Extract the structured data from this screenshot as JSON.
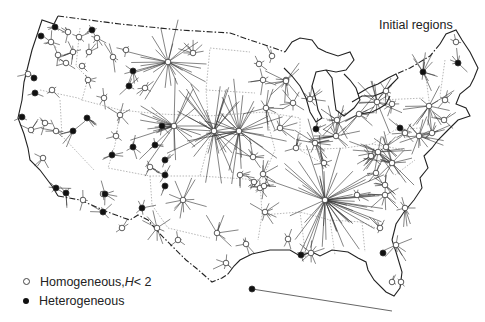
{
  "title": "Initial regions",
  "legend": {
    "homogeneous": {
      "label": "Homogeneous, ",
      "var": "H",
      "cond": " < 2",
      "symbol": "open-circle"
    },
    "heterogeneous": {
      "label": "Heterogeneous",
      "symbol": "filled-circle"
    }
  },
  "colors": {
    "line": "#222222",
    "spoke": "#333333",
    "border": "#999999",
    "background": "#ffffff"
  },
  "nodes": [
    {
      "x": 55,
      "y": 27,
      "type": "het",
      "spokes": 4,
      "len": 10
    },
    {
      "x": 41,
      "y": 36,
      "type": "het",
      "spokes": 0,
      "len": 0
    },
    {
      "x": 68,
      "y": 32,
      "type": "hom",
      "spokes": 5,
      "len": 12
    },
    {
      "x": 79,
      "y": 37,
      "type": "hom",
      "spokes": 4,
      "len": 10
    },
    {
      "x": 92,
      "y": 30,
      "type": "het",
      "spokes": 5,
      "len": 10
    },
    {
      "x": 97,
      "y": 38,
      "type": "hom",
      "spokes": 5,
      "len": 10
    },
    {
      "x": 51,
      "y": 42,
      "type": "hom",
      "spokes": 6,
      "len": 14
    },
    {
      "x": 73,
      "y": 52,
      "type": "hom",
      "spokes": 8,
      "len": 14
    },
    {
      "x": 89,
      "y": 52,
      "type": "hom",
      "spokes": 5,
      "len": 10
    },
    {
      "x": 58,
      "y": 55,
      "type": "hom",
      "spokes": 4,
      "len": 10
    },
    {
      "x": 66,
      "y": 63,
      "type": "hom",
      "spokes": 4,
      "len": 10
    },
    {
      "x": 82,
      "y": 66,
      "type": "hom",
      "spokes": 3,
      "len": 8
    },
    {
      "x": 113,
      "y": 57,
      "type": "hom",
      "spokes": 5,
      "len": 16
    },
    {
      "x": 126,
      "y": 50,
      "type": "hom",
      "spokes": 4,
      "len": 10
    },
    {
      "x": 168,
      "y": 62,
      "type": "hom",
      "spokes": 26,
      "len": 42
    },
    {
      "x": 193,
      "y": 53,
      "type": "hom",
      "spokes": 8,
      "len": 14
    },
    {
      "x": 28,
      "y": 74,
      "type": "hom",
      "spokes": 3,
      "len": 10
    },
    {
      "x": 34,
      "y": 78,
      "type": "het",
      "spokes": 0,
      "len": 0
    },
    {
      "x": 88,
      "y": 80,
      "type": "hom",
      "spokes": 5,
      "len": 12
    },
    {
      "x": 133,
      "y": 71,
      "type": "het",
      "spokes": 4,
      "len": 14
    },
    {
      "x": 145,
      "y": 88,
      "type": "hom",
      "spokes": 6,
      "len": 14
    },
    {
      "x": 35,
      "y": 93,
      "type": "het",
      "spokes": 3,
      "len": 10
    },
    {
      "x": 52,
      "y": 90,
      "type": "hom",
      "spokes": 4,
      "len": 12
    },
    {
      "x": 104,
      "y": 98,
      "type": "hom",
      "spokes": 5,
      "len": 14
    },
    {
      "x": 129,
      "y": 86,
      "type": "het",
      "spokes": 4,
      "len": 12
    },
    {
      "x": 120,
      "y": 115,
      "type": "hom",
      "spokes": 6,
      "len": 14
    },
    {
      "x": 162,
      "y": 126,
      "type": "het",
      "spokes": 4,
      "len": 12
    },
    {
      "x": 174,
      "y": 126,
      "type": "hom",
      "spokes": 24,
      "len": 46
    },
    {
      "x": 22,
      "y": 117,
      "type": "het",
      "spokes": 3,
      "len": 10
    },
    {
      "x": 31,
      "y": 130,
      "type": "hom",
      "spokes": 5,
      "len": 12
    },
    {
      "x": 45,
      "y": 123,
      "type": "hom",
      "spokes": 5,
      "len": 12
    },
    {
      "x": 56,
      "y": 131,
      "type": "hom",
      "spokes": 6,
      "len": 14
    },
    {
      "x": 87,
      "y": 118,
      "type": "het",
      "spokes": 5,
      "len": 18
    },
    {
      "x": 73,
      "y": 131,
      "type": "het",
      "spokes": 5,
      "len": 18
    },
    {
      "x": 116,
      "y": 136,
      "type": "hom",
      "spokes": 4,
      "len": 10
    },
    {
      "x": 133,
      "y": 147,
      "type": "het",
      "spokes": 5,
      "len": 14
    },
    {
      "x": 155,
      "y": 145,
      "type": "het",
      "spokes": 4,
      "len": 12
    },
    {
      "x": 112,
      "y": 155,
      "type": "het",
      "spokes": 5,
      "len": 12
    },
    {
      "x": 165,
      "y": 160,
      "type": "het",
      "spokes": 4,
      "len": 12
    },
    {
      "x": 43,
      "y": 158,
      "type": "hom",
      "spokes": 4,
      "len": 12
    },
    {
      "x": 56,
      "y": 188,
      "type": "het",
      "spokes": 5,
      "len": 14
    },
    {
      "x": 66,
      "y": 193,
      "type": "het",
      "spokes": 5,
      "len": 14
    },
    {
      "x": 83,
      "y": 200,
      "type": "hom",
      "spokes": 4,
      "len": 10
    },
    {
      "x": 103,
      "y": 194,
      "type": "hom",
      "spokes": 3,
      "len": 8
    },
    {
      "x": 105,
      "y": 194,
      "type": "het",
      "spokes": 5,
      "len": 16
    },
    {
      "x": 103,
      "y": 212,
      "type": "het",
      "spokes": 5,
      "len": 14
    },
    {
      "x": 142,
      "y": 208,
      "type": "het",
      "spokes": 5,
      "len": 14
    },
    {
      "x": 165,
      "y": 186,
      "type": "het",
      "spokes": 3,
      "len": 10
    },
    {
      "x": 165,
      "y": 175,
      "type": "het",
      "spokes": 4,
      "len": 10
    },
    {
      "x": 183,
      "y": 200,
      "type": "hom",
      "spokes": 12,
      "len": 26
    },
    {
      "x": 150,
      "y": 167,
      "type": "hom",
      "spokes": 6,
      "len": 14
    },
    {
      "x": 122,
      "y": 228,
      "type": "hom",
      "spokes": 4,
      "len": 10
    },
    {
      "x": 157,
      "y": 228,
      "type": "hom",
      "spokes": 8,
      "len": 18
    },
    {
      "x": 178,
      "y": 240,
      "type": "hom",
      "spokes": 4,
      "len": 10
    },
    {
      "x": 217,
      "y": 233,
      "type": "hom",
      "spokes": 8,
      "len": 20
    },
    {
      "x": 246,
      "y": 244,
      "type": "hom",
      "spokes": 6,
      "len": 14
    },
    {
      "x": 226,
      "y": 263,
      "type": "hom",
      "spokes": 6,
      "len": 14
    },
    {
      "x": 214,
      "y": 131,
      "type": "hom",
      "spokes": 30,
      "len": 50
    },
    {
      "x": 239,
      "y": 131,
      "type": "hom",
      "spokes": 30,
      "len": 50
    },
    {
      "x": 263,
      "y": 80,
      "type": "hom",
      "spokes": 6,
      "len": 14
    },
    {
      "x": 259,
      "y": 64,
      "type": "hom",
      "spokes": 4,
      "len": 10
    },
    {
      "x": 286,
      "y": 80,
      "type": "hom",
      "spokes": 4,
      "len": 10
    },
    {
      "x": 293,
      "y": 103,
      "type": "hom",
      "spokes": 7,
      "len": 16
    },
    {
      "x": 280,
      "y": 128,
      "type": "hom",
      "spokes": 8,
      "len": 18
    },
    {
      "x": 286,
      "y": 81,
      "type": "hom",
      "spokes": 10,
      "len": 22
    },
    {
      "x": 266,
      "y": 108,
      "type": "hom",
      "spokes": 10,
      "len": 22
    },
    {
      "x": 253,
      "y": 157,
      "type": "hom",
      "spokes": 8,
      "len": 18
    },
    {
      "x": 240,
      "y": 175,
      "type": "hom",
      "spokes": 6,
      "len": 14
    },
    {
      "x": 263,
      "y": 174,
      "type": "hom",
      "spokes": 8,
      "len": 16
    },
    {
      "x": 260,
      "y": 188,
      "type": "hom",
      "spokes": 6,
      "len": 14
    },
    {
      "x": 265,
      "y": 212,
      "type": "hom",
      "spokes": 8,
      "len": 18
    },
    {
      "x": 264,
      "y": 186,
      "type": "hom",
      "spokes": 6,
      "len": 14
    },
    {
      "x": 310,
      "y": 99,
      "type": "hom",
      "spokes": 8,
      "len": 16
    },
    {
      "x": 316,
      "y": 129,
      "type": "het",
      "spokes": 5,
      "len": 12
    },
    {
      "x": 337,
      "y": 120,
      "type": "hom",
      "spokes": 10,
      "len": 22
    },
    {
      "x": 315,
      "y": 143,
      "type": "hom",
      "spokes": 14,
      "len": 26
    },
    {
      "x": 324,
      "y": 163,
      "type": "hom",
      "spokes": 6,
      "len": 14
    },
    {
      "x": 336,
      "y": 136,
      "type": "hom",
      "spokes": 14,
      "len": 30
    },
    {
      "x": 296,
      "y": 148,
      "type": "hom",
      "spokes": 6,
      "len": 14
    },
    {
      "x": 325,
      "y": 200,
      "type": "hom",
      "spokes": 48,
      "len": 60
    },
    {
      "x": 357,
      "y": 195,
      "type": "hom",
      "spokes": 6,
      "len": 14
    },
    {
      "x": 377,
      "y": 102,
      "type": "hom",
      "spokes": 14,
      "len": 32
    },
    {
      "x": 359,
      "y": 114,
      "type": "hom",
      "spokes": 12,
      "len": 26
    },
    {
      "x": 386,
      "y": 91,
      "type": "hom",
      "spokes": 6,
      "len": 14
    },
    {
      "x": 371,
      "y": 156,
      "type": "hom",
      "spokes": 8,
      "len": 18
    },
    {
      "x": 376,
      "y": 173,
      "type": "hom",
      "spokes": 6,
      "len": 14
    },
    {
      "x": 378,
      "y": 152,
      "type": "hom",
      "spokes": 18,
      "len": 32
    },
    {
      "x": 385,
      "y": 185,
      "type": "hom",
      "spokes": 8,
      "len": 18
    },
    {
      "x": 392,
      "y": 163,
      "type": "hom",
      "spokes": 16,
      "len": 30
    },
    {
      "x": 400,
      "y": 128,
      "type": "het",
      "spokes": 5,
      "len": 14
    },
    {
      "x": 405,
      "y": 133,
      "type": "hom",
      "spokes": 6,
      "len": 14
    },
    {
      "x": 419,
      "y": 136,
      "type": "hom",
      "spokes": 16,
      "len": 28
    },
    {
      "x": 432,
      "y": 133,
      "type": "hom",
      "spokes": 8,
      "len": 18
    },
    {
      "x": 444,
      "y": 120,
      "type": "hom",
      "spokes": 6,
      "len": 14
    },
    {
      "x": 423,
      "y": 72,
      "type": "het",
      "spokes": 12,
      "len": 22
    },
    {
      "x": 458,
      "y": 63,
      "type": "het",
      "spokes": 6,
      "len": 14
    },
    {
      "x": 429,
      "y": 106,
      "type": "hom",
      "spokes": 14,
      "len": 28
    },
    {
      "x": 445,
      "y": 100,
      "type": "hom",
      "spokes": 6,
      "len": 14
    },
    {
      "x": 456,
      "y": 42,
      "type": "hom",
      "spokes": 3,
      "len": 8
    },
    {
      "x": 392,
      "y": 104,
      "type": "hom",
      "spokes": 6,
      "len": 14
    },
    {
      "x": 386,
      "y": 147,
      "type": "hom",
      "spokes": 6,
      "len": 14
    },
    {
      "x": 396,
      "y": 245,
      "type": "hom",
      "spokes": 8,
      "len": 18
    },
    {
      "x": 385,
      "y": 195,
      "type": "hom",
      "spokes": 10,
      "len": 18
    },
    {
      "x": 380,
      "y": 228,
      "type": "hom",
      "spokes": 6,
      "len": 14
    },
    {
      "x": 405,
      "y": 208,
      "type": "hom",
      "spokes": 8,
      "len": 18
    },
    {
      "x": 383,
      "y": 253,
      "type": "het",
      "spokes": 0,
      "len": 0
    },
    {
      "x": 392,
      "y": 282,
      "type": "hom",
      "spokes": 3,
      "len": 8
    },
    {
      "x": 401,
      "y": 282,
      "type": "hom",
      "spokes": 3,
      "len": 8
    },
    {
      "x": 252,
      "y": 289,
      "type": "het",
      "spokes": 0,
      "len": 0
    },
    {
      "x": 311,
      "y": 253,
      "type": "hom",
      "spokes": 8,
      "len": 14
    },
    {
      "x": 301,
      "y": 255,
      "type": "het",
      "spokes": 4,
      "len": 10
    },
    {
      "x": 288,
      "y": 239,
      "type": "hom",
      "spokes": 5,
      "len": 12
    },
    {
      "x": 254,
      "y": 182,
      "type": "hom",
      "spokes": 5,
      "len": 12
    },
    {
      "x": 272,
      "y": 56,
      "type": "hom",
      "spokes": 4,
      "len": 10
    }
  ]
}
